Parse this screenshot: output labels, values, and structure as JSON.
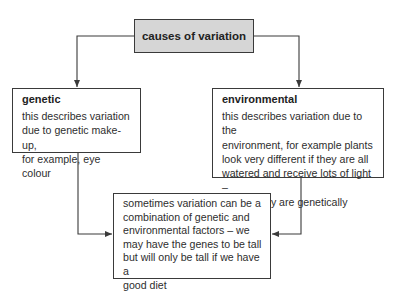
{
  "diagram": {
    "title": "causes of variation",
    "genetic": {
      "heading": "genetic",
      "text": "this describes variation\ndue to genetic make-up,\nfor example, eye colour"
    },
    "environmental": {
      "heading": "environmental",
      "text": "this describes variation due to the\nenvironment, for example plants\nlook very different if they are all\nwatered and receive lots of light –\neven if they are genetically similar"
    },
    "combination": {
      "text": "sometimes variation can be a\ncombination of genetic and\nenvironmental factors – we\nmay have the genes to be tall\nbut will only be tall if we have a\ngood diet"
    },
    "colors": {
      "title_fill": "#d6d6d6",
      "border": "#3a3a3a",
      "line": "#3a3a3a"
    }
  }
}
